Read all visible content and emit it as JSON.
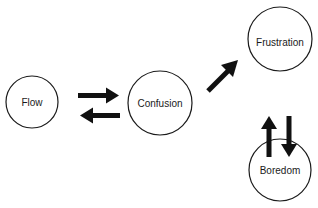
{
  "diagram": {
    "type": "state-transition",
    "colors": {
      "stroke": "#1a1a1a",
      "arrow": "#111111",
      "background": "#ffffff"
    },
    "nodes": [
      {
        "id": "flow",
        "label": "Flow",
        "cx": 32,
        "cy": 102,
        "r": 26
      },
      {
        "id": "confusion",
        "label": "Confusion",
        "cx": 160,
        "cy": 103,
        "r": 32
      },
      {
        "id": "frustration",
        "label": "Frustration",
        "cx": 280,
        "cy": 39,
        "r": 32
      },
      {
        "id": "boredom",
        "label": "Boredom",
        "cx": 280,
        "cy": 170,
        "r": 31
      }
    ],
    "edges": [
      {
        "from": "Flow",
        "to": "Confusion"
      },
      {
        "from": "Confusion",
        "to": "Flow"
      },
      {
        "from": "Confusion",
        "to": "Frustration"
      },
      {
        "from": "Boredom",
        "to": "Frustration"
      },
      {
        "from": "Frustration",
        "to": "Boredom"
      }
    ]
  }
}
